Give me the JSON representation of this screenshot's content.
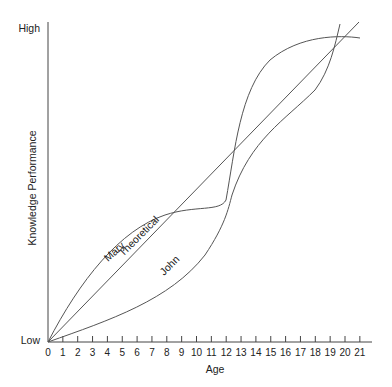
{
  "chart_data": {
    "type": "line",
    "title": "",
    "xlabel": "Age",
    "ylabel": "Knowledge Performance",
    "y_tick_labels": [
      "Low",
      "High"
    ],
    "x": [
      0,
      1,
      2,
      3,
      4,
      5,
      6,
      7,
      8,
      9,
      10,
      11,
      12,
      13,
      14,
      15,
      16,
      17,
      18,
      19,
      20,
      21
    ],
    "x_tick_labels": [
      "0",
      "1",
      "2",
      "3",
      "4",
      "5",
      "6",
      "7",
      "8",
      "9",
      "10",
      "11",
      "12",
      "13",
      "14",
      "15",
      "16",
      "17",
      "18",
      "19",
      "20",
      "21"
    ],
    "xlim": [
      0,
      21
    ],
    "ylim": [
      "Low",
      "High"
    ],
    "grid": false,
    "legend": "none (curves labeled inline)",
    "series": [
      {
        "name": "Mary",
        "description": "Rises quickly early, plateaus around age 10-12, then rises steeply and levels off near High by age 19-21",
        "values_normalized": [
          0,
          0.17,
          0.3,
          0.39,
          0.46,
          0.51,
          0.55,
          0.58,
          0.6,
          0.62,
          0.63,
          0.64,
          0.66,
          0.76,
          0.83,
          0.88,
          0.91,
          0.93,
          0.94,
          0.95,
          0.95,
          0.95
        ]
      },
      {
        "name": "Theoretical",
        "description": "Straight linear increase from Low at age 0 to High at age ~21",
        "values_normalized": [
          0,
          0.048,
          0.095,
          0.143,
          0.19,
          0.238,
          0.286,
          0.333,
          0.381,
          0.429,
          0.476,
          0.524,
          0.571,
          0.619,
          0.667,
          0.714,
          0.762,
          0.81,
          0.857,
          0.905,
          0.952,
          1.0
        ]
      },
      {
        "name": "John",
        "description": "Slow early growth, accelerates after age 10, crosses others around age 12 and rises steeply to High by age ~19-20",
        "values_normalized": [
          0,
          0.03,
          0.06,
          0.1,
          0.14,
          0.18,
          0.23,
          0.28,
          0.33,
          0.38,
          0.44,
          0.5,
          0.57,
          0.64,
          0.7,
          0.75,
          0.8,
          0.85,
          0.9,
          0.96,
          1.02,
          1.02
        ]
      }
    ],
    "annotations": [
      "Mary",
      "Theoretical",
      "John"
    ]
  },
  "axes": {
    "y_high": "High",
    "y_low": "Low",
    "y_title": "Knowledge Performance",
    "x_title": "Age",
    "x_ticks": [
      "0",
      "1",
      "2",
      "3",
      "4",
      "5",
      "6",
      "7",
      "8",
      "9",
      "10",
      "11",
      "12",
      "13",
      "14",
      "15",
      "16",
      "17",
      "18",
      "19",
      "20",
      "21"
    ]
  },
  "labels": {
    "mary": "Mary",
    "theoretical": "Theoretical",
    "john": "John"
  }
}
